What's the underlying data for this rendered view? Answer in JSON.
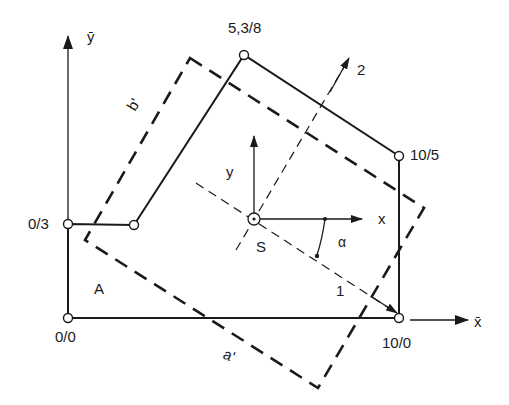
{
  "diagram": {
    "global_axes": {
      "y_label": "ȳ",
      "x_label": "x̄"
    },
    "vertices": [
      {
        "label": "0/0",
        "x": 0,
        "y": 0
      },
      {
        "label": "0/3",
        "x": 0,
        "y": 3
      },
      {
        "label": "",
        "x": 2,
        "y": 3
      },
      {
        "label": "5,3/8",
        "x": 5.3,
        "y": 8
      },
      {
        "label": "10/5",
        "x": 10,
        "y": 5
      },
      {
        "label": "10/0",
        "x": 10,
        "y": 0
      }
    ],
    "labels": {
      "v00": "0/0",
      "v03": "0/3",
      "v538": "5,3/8",
      "v105": "10/5",
      "v100": "10/0",
      "area": "A",
      "centroid": "S",
      "local_x": "x",
      "local_y": "y",
      "principal_1": "1",
      "principal_2": "2",
      "angle": "α",
      "side_a": "a'",
      "side_b": "b'"
    },
    "colors": {
      "line": "#1a1a1a",
      "background": "#ffffff"
    }
  }
}
